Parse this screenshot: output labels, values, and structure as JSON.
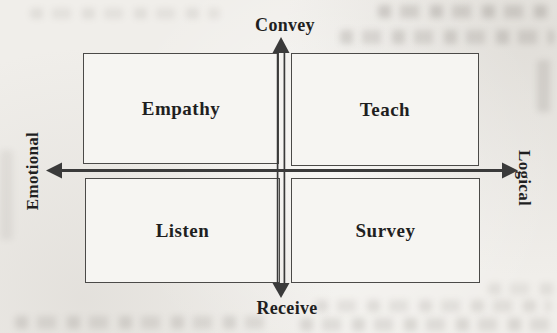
{
  "diagram": {
    "type": "2x2-quadrant-matrix",
    "axes": {
      "top": "Convey",
      "bottom": "Receive",
      "left": "Emotional",
      "right": "Logical"
    },
    "quadrants": {
      "top_left": "Empathy",
      "top_right": "Teach",
      "bottom_left": "Listen",
      "bottom_right": "Survey"
    },
    "colors": {
      "line": "#3a3a3a",
      "text": "#1f1f1f",
      "paper": "#f0eeea",
      "box_fill": "#f6f5f2"
    }
  }
}
